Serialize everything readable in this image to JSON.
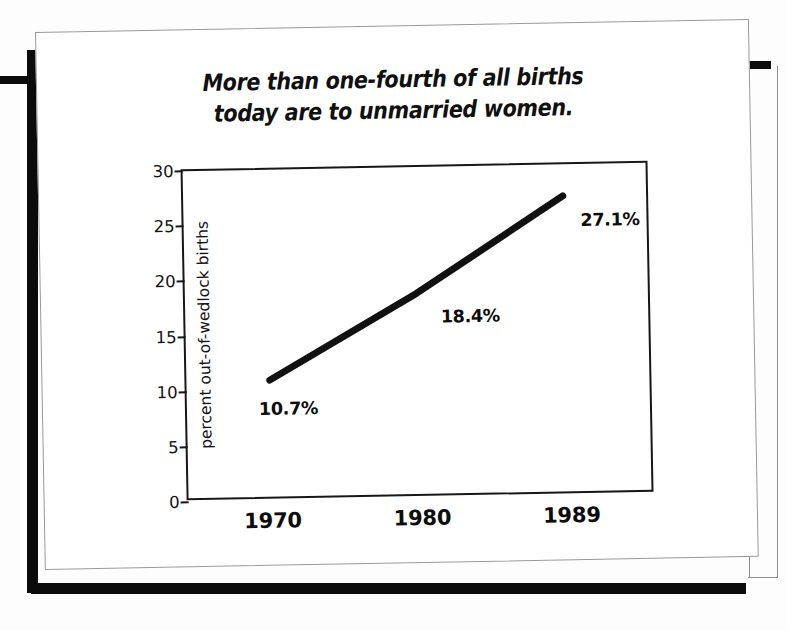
{
  "title": "More than one-fourth of all births today are to unmarried women.",
  "title_lines": [
    "More than one-fourth of all births",
    "today are to unmarried women."
  ],
  "colors": {
    "line": "#111111",
    "axis": "#171717",
    "text": "#0d0d0d",
    "frame": "#0b0b0b",
    "card": "#ffffff",
    "page_background": "#fdfdfd"
  },
  "chart_data": {
    "type": "line",
    "title": "More than one-fourth of all births today are to unmarried women.",
    "xlabel": "",
    "ylabel": "percent out-of-wedlock births",
    "categories": [
      "1970",
      "1980",
      "1989"
    ],
    "x": [
      1970,
      1980,
      1989
    ],
    "values": [
      10.7,
      18.4,
      27.1
    ],
    "point_labels": [
      "10.7%",
      "18.4%",
      "27.1%"
    ],
    "series": [
      {
        "name": "percent out-of-wedlock births",
        "values": [
          10.7,
          18.4,
          27.1
        ]
      }
    ],
    "ylim": [
      0,
      30
    ],
    "yticks": [
      0,
      5,
      10,
      15,
      20,
      25,
      30
    ],
    "ytick_labels": [
      "0",
      "5",
      "10",
      "15",
      "20",
      "25",
      "30"
    ],
    "xtick_labels": [
      "1970",
      "1980",
      "1989"
    ],
    "grid": false,
    "legend": false,
    "legend_position": "none",
    "line_width_px": 7,
    "annotations": [
      {
        "text": "10.7%",
        "x": 1970,
        "y": 10.7,
        "placement": "below-left"
      },
      {
        "text": "18.4%",
        "x": 1980,
        "y": 18.4,
        "placement": "below-right"
      },
      {
        "text": "27.1%",
        "x": 1989,
        "y": 27.1,
        "placement": "below-right"
      }
    ]
  }
}
